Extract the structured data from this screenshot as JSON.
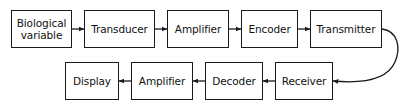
{
  "diagram": {
    "stroke_color": "#1a1a1a",
    "background_color": "#ffffff",
    "nodes": [
      {
        "id": "biological-variable",
        "label": "Biological\nvariable",
        "x": 11,
        "y": 10,
        "w": 61,
        "h": 38,
        "row": "top"
      },
      {
        "id": "transducer",
        "label": "Transducer",
        "x": 84,
        "y": 10,
        "w": 71,
        "h": 38,
        "row": "top"
      },
      {
        "id": "amplifier-top",
        "label": "Amplifier",
        "x": 167,
        "y": 10,
        "w": 62,
        "h": 38,
        "row": "top"
      },
      {
        "id": "encoder",
        "label": "Encoder",
        "x": 241,
        "y": 10,
        "w": 57,
        "h": 38,
        "row": "top"
      },
      {
        "id": "transmitter",
        "label": "Transmitter",
        "x": 310,
        "y": 10,
        "w": 72,
        "h": 38,
        "row": "top"
      },
      {
        "id": "display",
        "label": "Display",
        "x": 65,
        "y": 62,
        "w": 54,
        "h": 38,
        "row": "bottom"
      },
      {
        "id": "amplifier-bottom",
        "label": "Amplifier",
        "x": 131,
        "y": 62,
        "w": 62,
        "h": 38,
        "row": "bottom"
      },
      {
        "id": "decoder",
        "label": "Decoder",
        "x": 205,
        "y": 62,
        "w": 58,
        "h": 38,
        "row": "bottom"
      },
      {
        "id": "receiver",
        "label": "Receiver",
        "x": 275,
        "y": 62,
        "w": 58,
        "h": 38,
        "row": "bottom"
      }
    ],
    "connectors": [
      {
        "id": "arrow-biological-variable-to-transducer",
        "from": "biological-variable",
        "to": "transducer",
        "kind": "straight",
        "direction": "right",
        "x1": 72,
        "y1": 29,
        "x2": 84,
        "y2": 29
      },
      {
        "id": "arrow-transducer-to-amplifier-top",
        "from": "transducer",
        "to": "amplifier-top",
        "kind": "straight",
        "direction": "right",
        "x1": 155,
        "y1": 29,
        "x2": 167,
        "y2": 29
      },
      {
        "id": "arrow-amplifier-top-to-encoder",
        "from": "amplifier-top",
        "to": "encoder",
        "kind": "straight",
        "direction": "right",
        "x1": 229,
        "y1": 29,
        "x2": 241,
        "y2": 29
      },
      {
        "id": "arrow-encoder-to-transmitter",
        "from": "encoder",
        "to": "transmitter",
        "kind": "straight",
        "direction": "right",
        "x1": 298,
        "y1": 29,
        "x2": 310,
        "y2": 29
      },
      {
        "id": "arrow-transmitter-to-receiver",
        "from": "transmitter",
        "to": "receiver",
        "kind": "curved",
        "direction": "left",
        "path": "M 382 29 C 398 31 401 48 395 62 C 388 78 366 84 333 81"
      },
      {
        "id": "arrow-receiver-to-decoder",
        "from": "receiver",
        "to": "decoder",
        "kind": "straight",
        "direction": "left",
        "x1": 275,
        "y1": 81,
        "x2": 263,
        "y2": 81
      },
      {
        "id": "arrow-decoder-to-amplifier-bottom",
        "from": "decoder",
        "to": "amplifier-bottom",
        "kind": "straight",
        "direction": "left",
        "x1": 205,
        "y1": 81,
        "x2": 193,
        "y2": 81
      },
      {
        "id": "arrow-amplifier-bottom-to-display",
        "from": "amplifier-bottom",
        "to": "display",
        "kind": "straight",
        "direction": "left",
        "x1": 131,
        "y1": 81,
        "x2": 119,
        "y2": 81
      }
    ]
  }
}
